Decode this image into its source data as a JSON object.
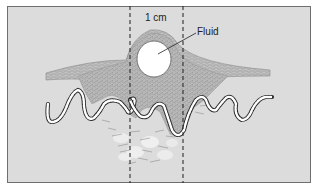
{
  "diagram": {
    "labels": {
      "measurement": "1 cm",
      "fluid": "Fluid"
    },
    "colors": {
      "background": "#dcdcdc",
      "frame": "#6f6f6f",
      "tissue": "#b4b4b4",
      "tissue_cells": "#8c8c8c",
      "fluid": "#ffffff",
      "chain": "#2a2a2a",
      "dashed_lines": "#1e1e1e"
    },
    "elements": [
      "raised skin layer (epidermis)",
      "fluid-filled blister (1 cm wide)",
      "dense cellular tissue mass",
      "wavy beaded basement membrane",
      "loose dermal tissue with fat lobules",
      "two vertical dashed lines marking 1 cm"
    ]
  }
}
